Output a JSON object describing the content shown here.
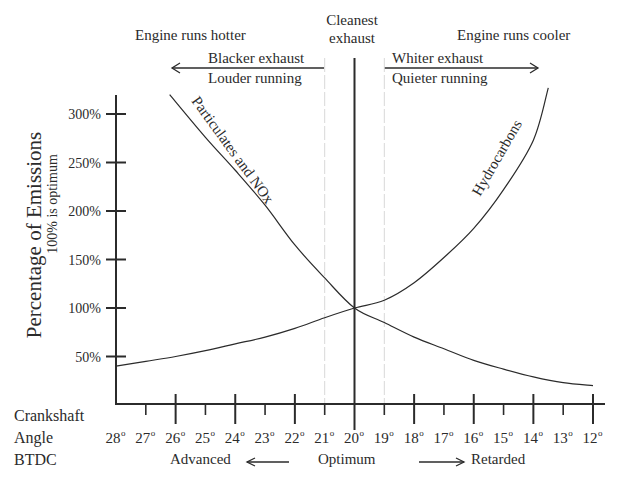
{
  "chart_data": {
    "type": "line",
    "title": "",
    "ylabel": "Percentage of Emissions",
    "ylabel_sub": "100% is optimum",
    "xlabel_lines": [
      "Crankshaft",
      "Angle",
      "BTDC"
    ],
    "ylim": [
      0,
      320
    ],
    "xlim": [
      28,
      12
    ],
    "y_ticks": [
      50,
      100,
      150,
      200,
      250,
      300
    ],
    "y_tick_labels": [
      "50%",
      "100%",
      "150%",
      "200%",
      "250%",
      "300%"
    ],
    "x_ticks": [
      28,
      27,
      26,
      25,
      24,
      23,
      22,
      21,
      20,
      19,
      18,
      17,
      16,
      15,
      14,
      13,
      12
    ],
    "x_tick_labels": [
      "28",
      "27",
      "26",
      "25",
      "24",
      "23",
      "22",
      "21",
      "20",
      "19",
      "18",
      "17",
      "16",
      "15",
      "14",
      "13",
      "12"
    ],
    "x_tick_suffix": "o",
    "x_major_ticks": [
      26,
      24,
      22,
      20,
      18,
      16,
      14,
      12
    ],
    "grid": false,
    "optimum_x": 20,
    "dashed_guides_x": [
      21,
      19
    ],
    "series": [
      {
        "name": "Particulates and NOx",
        "x": [
          26.2,
          25,
          24,
          23,
          22,
          21,
          20,
          19,
          18,
          17,
          16,
          15,
          14,
          13,
          12
        ],
        "values": [
          320,
          276,
          242,
          206,
          165,
          131,
          100,
          85,
          70,
          58,
          46,
          37,
          29,
          23,
          20
        ]
      },
      {
        "name": "Hydrocarbons",
        "x": [
          28,
          27,
          26,
          25,
          24,
          23,
          22,
          21,
          20,
          19,
          18,
          17,
          16,
          15,
          14,
          13.5
        ],
        "values": [
          40,
          45,
          50,
          56,
          63,
          70,
          79,
          90,
          100,
          108,
          126,
          152,
          182,
          222,
          273,
          327
        ]
      }
    ],
    "annotations": {
      "top_center": [
        "Cleanest",
        "exhaust"
      ],
      "top_left": "Engine runs hotter",
      "top_right": "Engine runs cooler",
      "left_arrow_lines": [
        "Blacker exhaust",
        "Louder running"
      ],
      "right_arrow_lines": [
        "Whiter exhaust",
        "Quieter running"
      ],
      "bottom_left": "Advanced",
      "bottom_center": "Optimum",
      "bottom_right": "Retarded"
    }
  }
}
